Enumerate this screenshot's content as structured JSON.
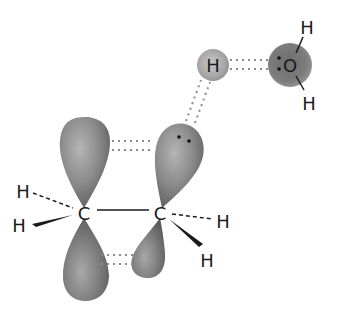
{
  "diagram": {
    "type": "molecular-orbital-diagram",
    "colors": {
      "background": "#ffffff",
      "orbital_fill": "#8a8a8a",
      "orbital_dark": "#5e5e5e",
      "orbital_light": "#b5b5b5",
      "text": "#1a1a1a",
      "dotted_line": "#8c8c8c"
    },
    "atoms": {
      "carbon_left": {
        "label": "C"
      },
      "carbon_right": {
        "label": "C"
      },
      "h_left_top": {
        "label": "H"
      },
      "h_left_bottom": {
        "label": "H"
      },
      "h_right_dashed": {
        "label": "H"
      },
      "h_right_wedge": {
        "label": "H"
      },
      "h_bridging": {
        "label": "H"
      },
      "oxygen": {
        "label": "O"
      },
      "h_water_top": {
        "label": "H"
      },
      "h_water_bottom": {
        "label": "H"
      }
    },
    "lone_pairs": [
      {
        "on": "right-carbon-top-lobe",
        "electrons": 2
      },
      {
        "on": "oxygen",
        "electrons": 2
      }
    ],
    "bonds": [
      {
        "from": "carbon_left",
        "to": "carbon_right",
        "style": "solid"
      },
      {
        "from": "carbon_left",
        "to": "h_left_top",
        "style": "dashed"
      },
      {
        "from": "carbon_left",
        "to": "h_left_bottom",
        "style": "wedge"
      },
      {
        "from": "carbon_right",
        "to": "h_right_dashed",
        "style": "dashed"
      },
      {
        "from": "carbon_right",
        "to": "h_right_wedge",
        "style": "wedge"
      },
      {
        "from": "oxygen",
        "to": "h_water_top",
        "style": "solid"
      },
      {
        "from": "oxygen",
        "to": "h_water_bottom",
        "style": "solid"
      }
    ],
    "interactions": [
      {
        "between": [
          "left-top-lobe",
          "right-top-lobe"
        ],
        "style": "dotted-double"
      },
      {
        "between": [
          "left-bottom-lobe",
          "right-bottom-lobe"
        ],
        "style": "dotted-double"
      },
      {
        "between": [
          "right-top-lobe",
          "h_bridging"
        ],
        "style": "dotted-double"
      },
      {
        "between": [
          "h_bridging",
          "oxygen"
        ],
        "style": "dotted-double"
      }
    ]
  }
}
